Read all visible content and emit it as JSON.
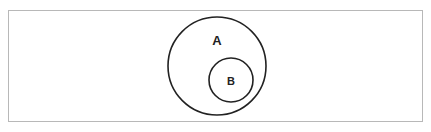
{
  "diagram": {
    "type": "venn-subset",
    "sets": [
      {
        "label": "A",
        "role": "outer-set"
      },
      {
        "label": "B",
        "role": "subset-of-A"
      }
    ],
    "colors": {
      "stroke": "#222222",
      "frame": "#b8b8b8",
      "background": "#ffffff"
    }
  }
}
